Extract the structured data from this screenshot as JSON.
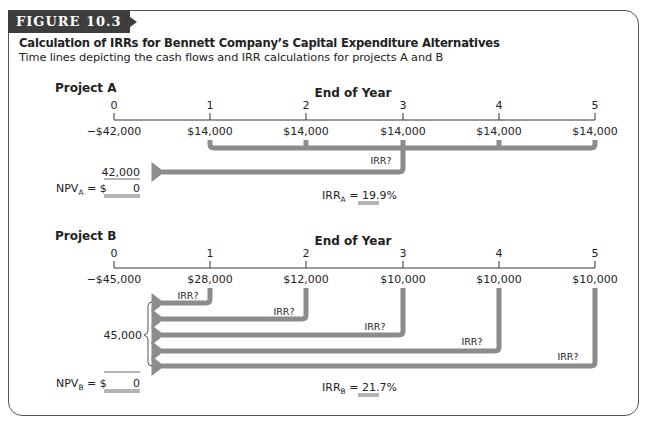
{
  "figure": {
    "tab_label": "FIGURE 10.3",
    "title": "Calculation of IRRs for Bennett Company’s Capital Expenditure Alternatives",
    "subtitle": "Time lines depicting the cash flows and IRR calculations for projects A and B"
  },
  "axis_label": "End of Year",
  "irr_marker": "IRR?",
  "project_a": {
    "label": "Project A",
    "years": [
      "0",
      "1",
      "2",
      "3",
      "4",
      "5"
    ],
    "cash_flows": [
      "−$42,000",
      "$14,000",
      "$14,000",
      "$14,000",
      "$14,000",
      "$14,000"
    ],
    "pv_total": "42,000",
    "npv_prefix": "NPV",
    "npv_sub": "A",
    "npv_eq": " = $",
    "npv_value": "0",
    "irr_prefix": "IRR",
    "irr_sub": "A",
    "irr_eq": " = ",
    "irr_value": "19.9%"
  },
  "project_b": {
    "label": "Project B",
    "years": [
      "0",
      "1",
      "2",
      "3",
      "4",
      "5"
    ],
    "cash_flows": [
      "−$45,000",
      "$28,000",
      "$12,000",
      "$10,000",
      "$10,000",
      "$10,000"
    ],
    "pv_total": "45,000",
    "npv_prefix": "NPV",
    "npv_sub": "B",
    "npv_eq": " = $",
    "npv_value": "0",
    "irr_prefix": "IRR",
    "irr_sub": "B",
    "irr_eq": " = ",
    "irr_value": "21.7%"
  },
  "colors": {
    "arrow": "#8c8c8c",
    "tab_bg": "#3d3d3d",
    "frame": "#555555"
  }
}
